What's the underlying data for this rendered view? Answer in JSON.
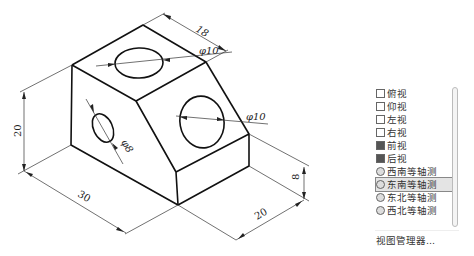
{
  "top_caption": "",
  "drawing": {
    "title": "isometric part drawing",
    "dimensions": {
      "top_depth": "18",
      "top_hole_dia": "φ10",
      "right_hole_dia": "φ10",
      "left_hole_dia": "φ8",
      "height": "20",
      "length": "30",
      "width": "20",
      "step_height": "8"
    }
  },
  "view_menu": {
    "items": [
      {
        "label": "俯视",
        "icon": "top-view-icon"
      },
      {
        "label": "仰视",
        "icon": "bottom-view-icon"
      },
      {
        "label": "左视",
        "icon": "left-view-icon"
      },
      {
        "label": "右视",
        "icon": "right-view-icon"
      },
      {
        "label": "前视",
        "icon": "front-view-icon"
      },
      {
        "label": "后视",
        "icon": "back-view-icon"
      },
      {
        "label": "西南等轴测",
        "icon": "sw-isometric-icon"
      },
      {
        "label": "东南等轴测",
        "icon": "se-isometric-icon",
        "selected": true
      },
      {
        "label": "东北等轴测",
        "icon": "ne-isometric-icon"
      },
      {
        "label": "西北等轴测",
        "icon": "nw-isometric-icon"
      }
    ],
    "manager_label": "视图管理器..."
  }
}
